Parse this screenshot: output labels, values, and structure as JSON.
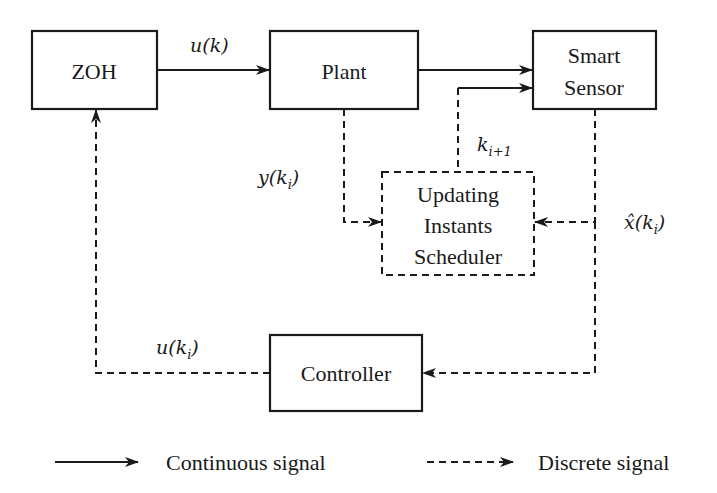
{
  "diagram": {
    "blocks": {
      "zoh": {
        "label": "ZOH"
      },
      "plant": {
        "label": "Plant"
      },
      "sensor": {
        "line1": "Smart",
        "line2": "Sensor"
      },
      "scheduler": {
        "line1": "Updating",
        "line2": "Instants",
        "line3": "Scheduler"
      },
      "controller": {
        "label": "Controller"
      }
    },
    "signals": {
      "u_k": {
        "base": "u(k)"
      },
      "y_ki": {
        "base": "y(k",
        "sub": "i",
        "close": ")"
      },
      "k_next": {
        "base": "k",
        "sub": "i+1"
      },
      "xhat_ki": {
        "base": "x̂(k",
        "sub": "i",
        "close": ")"
      },
      "u_ki": {
        "base": "u(k",
        "sub": "i",
        "close": ")"
      }
    },
    "legend": {
      "continuous": "Continuous signal",
      "discrete": "Discrete signal"
    }
  }
}
